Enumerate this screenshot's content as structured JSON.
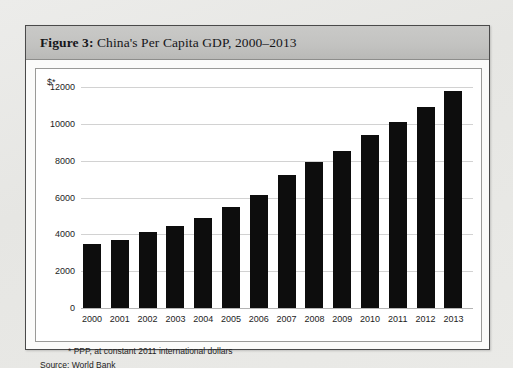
{
  "figure": {
    "label": "Figure 3:",
    "title": " China's Per Capita GDP, 2000–2013",
    "footnote": "* PPP, at constant 2011 international dollars",
    "source": "Source: World Bank",
    "y_unit": "$*"
  },
  "chart_data": {
    "type": "bar",
    "title": "China's Per Capita GDP, 2000–2013",
    "xlabel": "",
    "ylabel": "$*",
    "categories": [
      "2000",
      "2001",
      "2002",
      "2003",
      "2004",
      "2005",
      "2006",
      "2007",
      "2008",
      "2009",
      "2010",
      "2011",
      "2012",
      "2013"
    ],
    "values": [
      3490,
      3710,
      4110,
      4450,
      4870,
      5490,
      6150,
      7200,
      7950,
      8550,
      9390,
      10120,
      10910,
      11760
    ],
    "ylim": [
      0,
      12000
    ],
    "yticks": [
      0,
      2000,
      4000,
      6000,
      8000,
      10000,
      12000
    ],
    "ytick_labels": [
      "0",
      "2000",
      "4000",
      "6000",
      "8000",
      "10000",
      "12000"
    ],
    "grid": true,
    "legend": "none",
    "bar_color": "#0d0d0d",
    "annotations": [
      "* PPP, at constant 2011 international dollars",
      "Source: World Bank"
    ]
  }
}
